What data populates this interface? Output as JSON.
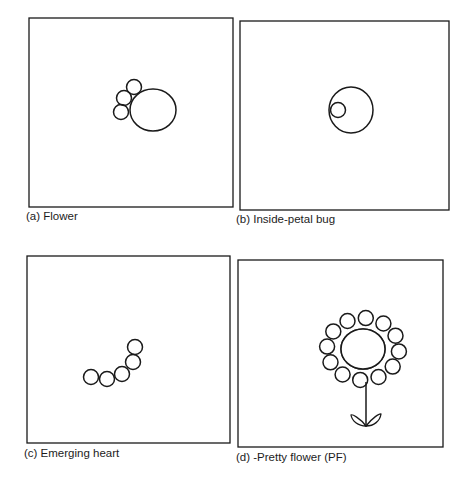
{
  "figure": {
    "panels": [
      {
        "id": "a",
        "caption": "(a) Flower",
        "frame": {
          "x": 29,
          "y": 18,
          "w": 204,
          "h": 189
        },
        "center": {
          "cx": 153,
          "cy": 110,
          "rx": 23,
          "ry": 21
        },
        "petals": [
          {
            "cx": 134,
            "cy": 87,
            "r": 7.5
          },
          {
            "cx": 124,
            "cy": 98,
            "r": 7.5
          },
          {
            "cx": 121,
            "cy": 112,
            "r": 7.5
          }
        ]
      },
      {
        "id": "b",
        "caption": "(b) Inside-petal bug",
        "frame": {
          "x": 240,
          "y": 21,
          "w": 209,
          "h": 189
        },
        "center": {
          "cx": 351,
          "cy": 110,
          "rx": 22,
          "ry": 23
        },
        "bug": {
          "cx": 338,
          "cy": 110,
          "r": 7.5
        }
      },
      {
        "id": "c",
        "caption": "(c) Emerging heart",
        "frame": {
          "x": 27,
          "y": 256,
          "w": 203,
          "h": 187
        },
        "petals": [
          {
            "cx": 91,
            "cy": 377,
            "r": 7.5
          },
          {
            "cx": 107,
            "cy": 379,
            "r": 7.5
          },
          {
            "cx": 122,
            "cy": 374,
            "r": 7.5
          },
          {
            "cx": 133,
            "cy": 362,
            "r": 7.5
          },
          {
            "cx": 135,
            "cy": 347,
            "r": 7.5
          }
        ]
      },
      {
        "id": "d",
        "caption": "(d) -Pretty flower (PF)",
        "frame": {
          "x": 238,
          "y": 260,
          "w": 205,
          "h": 187
        },
        "center": {
          "cx": 363,
          "cy": 349,
          "rx": 22,
          "ry": 20
        },
        "petal_count": 12,
        "petal_r": 7.5,
        "petal_ring": {
          "rx": 36,
          "ry": 31
        },
        "stem": {
          "x": 366,
          "y1": 382,
          "y2": 426
        },
        "leaves": [
          {
            "d": "M366 426 C360 418 352 414 351 415 C352 421 358 426 366 426 Z"
          },
          {
            "d": "M366 426 C372 418 380 413 381 414 C380 421 374 426 366 426 Z"
          }
        ]
      }
    ]
  },
  "style": {
    "stroke_color": "#1a1a1a",
    "background": "#ffffff"
  }
}
